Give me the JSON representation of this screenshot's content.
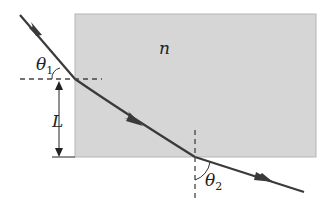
{
  "diagram": {
    "title": "",
    "slab": {
      "label": "n",
      "fill": "#d6d6d6",
      "stroke": "#b0b0b0"
    },
    "labels": {
      "theta1_main": "θ",
      "theta1_sub": "1",
      "theta2_main": "θ",
      "theta2_sub": "2",
      "length": "L",
      "index": "n"
    },
    "colors": {
      "ray": "#3a3a3a",
      "dash": "#444444",
      "text": "#222222"
    }
  }
}
